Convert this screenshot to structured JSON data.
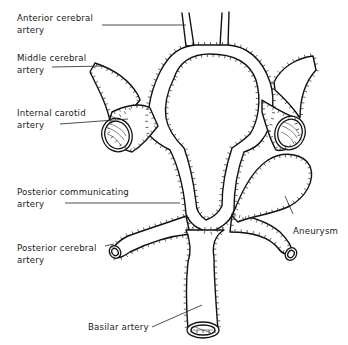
{
  "diagram": {
    "labels": {
      "anterior_cerebral": [
        "Anterior cerebral",
        "artery"
      ],
      "middle_cerebral": [
        "Middle cerebral",
        "artery"
      ],
      "internal_carotid": [
        "Internal carotid",
        "artery"
      ],
      "posterior_communicating": [
        "Posterior communicating",
        "artery"
      ],
      "posterior_cerebral": [
        "Posterior cerebral",
        "artery"
      ],
      "basilar": [
        "Basilar artery"
      ],
      "aneurysm": [
        "Aneurysm"
      ]
    },
    "colors": {
      "line": "#111111",
      "fill": "#ffffff",
      "text": "#1a1a1a"
    }
  }
}
